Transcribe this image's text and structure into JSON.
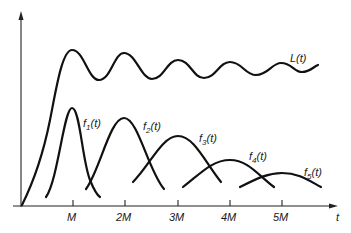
{
  "diagram": {
    "axes": {
      "x_label": "t",
      "ticks": [
        "M",
        "2M",
        "3M",
        "4M",
        "5M"
      ]
    },
    "curves": [
      {
        "id": "L",
        "label": "L(t)"
      },
      {
        "id": "f1",
        "label": "f",
        "sub": "1",
        "arg": "(t)"
      },
      {
        "id": "f2",
        "label": "f",
        "sub": "2",
        "arg": "(t)"
      },
      {
        "id": "f3",
        "label": "f",
        "sub": "3",
        "arg": "(t)"
      },
      {
        "id": "f4",
        "label": "f",
        "sub": "4",
        "arg": "(t)"
      },
      {
        "id": "f5",
        "label": "f",
        "sub": "5",
        "arg": "(t)"
      }
    ],
    "colors": {
      "stroke": "#111111",
      "background": "#ffffff"
    }
  }
}
